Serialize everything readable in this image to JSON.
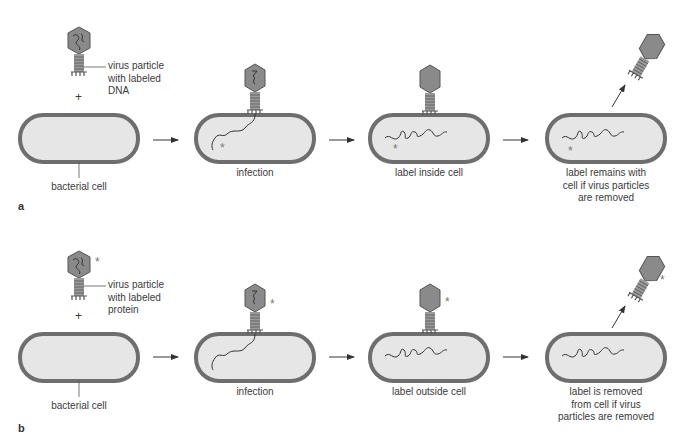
{
  "colors": {
    "cell_wall": "#6e6e6e",
    "cell_fill": "#e6e6e6",
    "virus_fill": "#8a8a8a",
    "dna": "#3a3a3a",
    "text": "#3a3a3a",
    "background": "#ffffff"
  },
  "panels": [
    {
      "letter": "a",
      "virus_label": [
        "virus particle",
        "with labeled",
        "DNA"
      ],
      "plus": "+",
      "start_label": "bacterial cell",
      "steps": [
        {
          "label": [
            "infection"
          ]
        },
        {
          "label": [
            "label inside cell"
          ]
        },
        {
          "label": [
            "label remains with",
            "cell if virus particles",
            "are removed"
          ]
        }
      ],
      "marker": "*"
    },
    {
      "letter": "b",
      "virus_label": [
        "virus particle",
        "with labeled",
        "protein"
      ],
      "plus": "+",
      "start_label": "bacterial cell",
      "steps": [
        {
          "label": [
            "infection"
          ]
        },
        {
          "label": [
            "label outside cell"
          ]
        },
        {
          "label": [
            "label is removed",
            "from cell if virus",
            "particles are removed"
          ]
        }
      ],
      "marker": "*"
    }
  ]
}
